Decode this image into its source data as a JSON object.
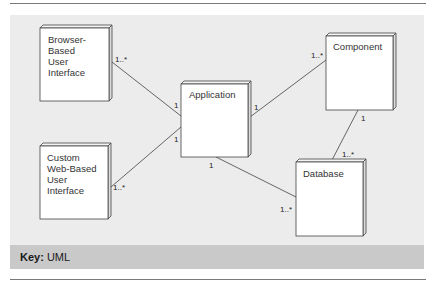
{
  "diagram": {
    "type": "UML deployment diagram",
    "nodes": [
      {
        "id": "browser_ui",
        "label_lines": [
          "Browser-",
          "Based",
          "User",
          "Interface"
        ]
      },
      {
        "id": "custom_web_ui",
        "label_lines": [
          "Custom",
          "Web-Based",
          "User",
          "Interface"
        ]
      },
      {
        "id": "application",
        "label_lines": [
          "Application"
        ]
      },
      {
        "id": "component",
        "label_lines": [
          "Component"
        ]
      },
      {
        "id": "database",
        "label_lines": [
          "Database"
        ]
      }
    ],
    "associations": [
      {
        "from": "browser_ui",
        "to": "application",
        "from_mult": "1..*",
        "to_mult": "1"
      },
      {
        "from": "custom_web_ui",
        "to": "application",
        "from_mult": "1..*",
        "to_mult": "1"
      },
      {
        "from": "application",
        "to": "component",
        "from_mult": "1",
        "to_mult": "1..*"
      },
      {
        "from": "application",
        "to": "database",
        "from_mult": "1",
        "to_mult": "1..*"
      },
      {
        "from": "component",
        "to": "database",
        "from_mult": "1",
        "to_mult": "1..*"
      }
    ]
  },
  "key": {
    "label": "Key:",
    "value": "UML"
  },
  "colors": {
    "panel_bg": "#ececec",
    "key_bg": "#c9c9c9",
    "node_fill": "#ffffff",
    "line": "#555555"
  }
}
